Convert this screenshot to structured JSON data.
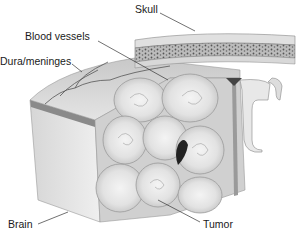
{
  "diagram": {
    "type": "anatomical-illustration",
    "labels": [
      {
        "id": "skull",
        "text": "Skull"
      },
      {
        "id": "blood-vessels",
        "text": "Blood vessels"
      },
      {
        "id": "dura",
        "text": "Dura/meninges"
      },
      {
        "id": "brain",
        "text": "Brain"
      },
      {
        "id": "tumor",
        "text": "Tumor"
      }
    ]
  }
}
